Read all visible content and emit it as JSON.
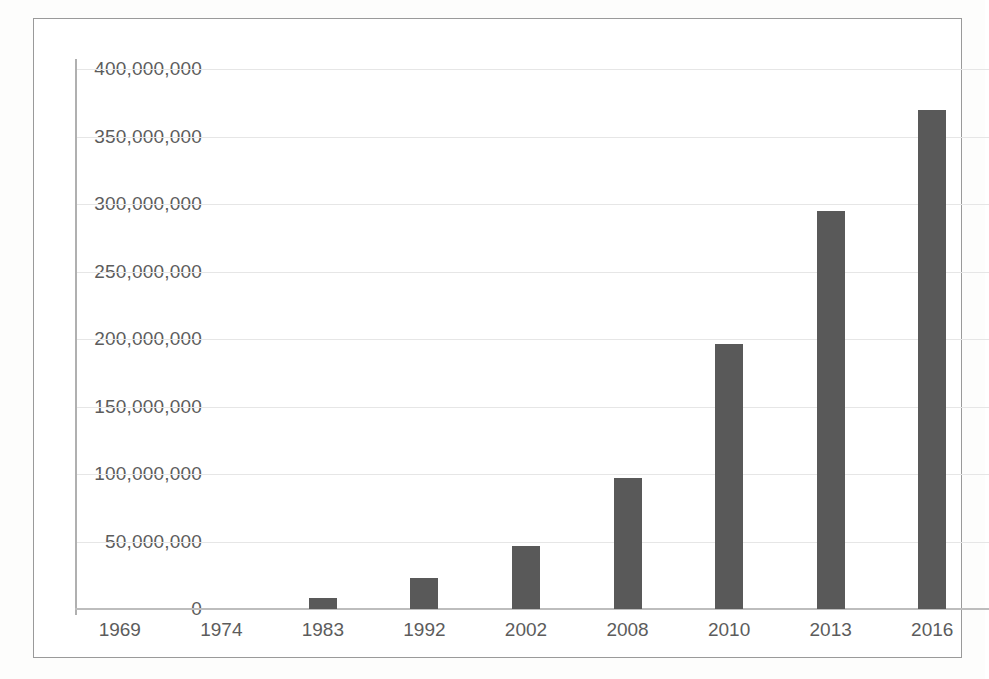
{
  "chart_data": {
    "type": "bar",
    "title": "",
    "subtitle": "",
    "xlabel": "",
    "ylabel": "",
    "categories": [
      "1969",
      "1974",
      "1983",
      "1992",
      "2002",
      "2008",
      "2010",
      "2013",
      "2016"
    ],
    "values": [
      0,
      0,
      8500000,
      23000000,
      47000000,
      97000000,
      196000000,
      295000000,
      370000000
    ],
    "series": [
      {
        "name": "",
        "values": [
          0,
          0,
          8500000,
          23000000,
          47000000,
          97000000,
          196000000,
          295000000,
          370000000
        ]
      }
    ],
    "ylim": [
      0,
      400000000
    ],
    "ytick_values": [
      0,
      50000000,
      100000000,
      150000000,
      200000000,
      250000000,
      300000000,
      350000000,
      400000000
    ],
    "ytick_labels": [
      "0",
      "50,000,000",
      "100,000,000",
      "150,000,000",
      "200,000,000",
      "250,000,000",
      "300,000,000",
      "350,000,000",
      "400,000,000"
    ],
    "grid": true,
    "grid_axis": "y",
    "legend": false,
    "legend_position": "none",
    "bar_color": "#595959",
    "gridline_color": "#e6e6e6",
    "axis_line_color": "#b0b0b0",
    "text_color": "#5c5c5c",
    "frame_color": "#9a9a9a",
    "background_color": "#ffffff"
  }
}
